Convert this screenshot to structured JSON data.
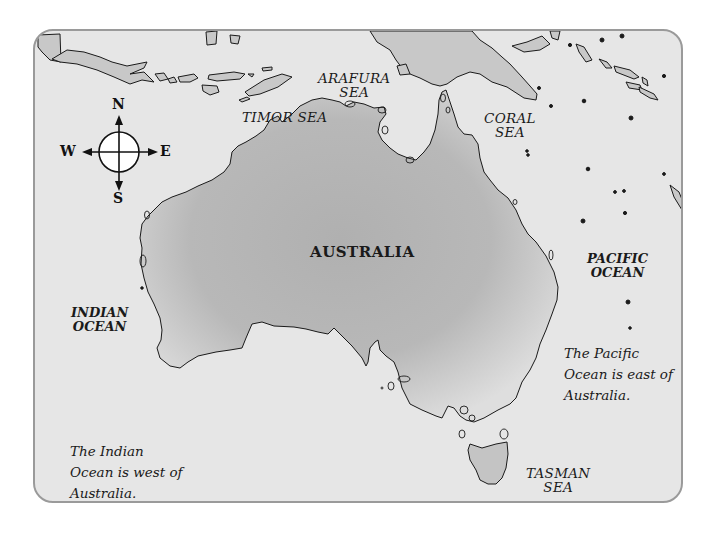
{
  "map": {
    "title": "Map of Australia",
    "colors": {
      "sea": "#e6e6e6",
      "land_center": "#b4b4b4",
      "land_edge": "#dcdcdc",
      "neighbor_land": "#c8c8c8",
      "frame_border": "#9a9a9a",
      "outline": "#1a1a1a"
    },
    "country_label": "AUSTRALIA",
    "seas": [
      {
        "id": "timor",
        "label": "TIMOR SEA"
      },
      {
        "id": "arafura",
        "line1": "ARAFURA",
        "line2": "SEA"
      },
      {
        "id": "coral",
        "line1": "CORAL",
        "line2": "SEA"
      },
      {
        "id": "tasman",
        "line1": "TASMAN",
        "line2": "SEA"
      }
    ],
    "oceans": [
      {
        "id": "indian",
        "line1": "INDIAN",
        "line2": "OCEAN"
      },
      {
        "id": "pacific",
        "line1": "PACIFIC",
        "line2": "OCEAN"
      }
    ],
    "notes": [
      {
        "id": "indian-note",
        "text": "The Indian Ocean is west of Australia."
      },
      {
        "id": "pacific-note",
        "text": "The Pacific Ocean is east of Australia."
      }
    ],
    "compass": {
      "icon": "compass-rose-icon",
      "north": "N",
      "south": "S",
      "east": "E",
      "west": "W"
    }
  }
}
